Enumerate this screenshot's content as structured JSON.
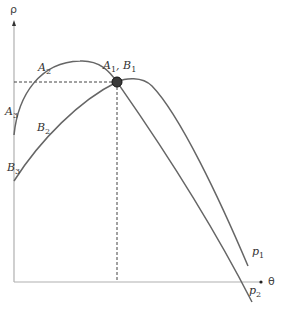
{
  "axes": {
    "y_label": "ρ",
    "x_label": "θ"
  },
  "points": {
    "intersection": {
      "label_a": "A",
      "sub_a": "1",
      "sep": ",",
      "label_b": "B",
      "sub_b": "1"
    },
    "a2": {
      "label": "A",
      "sub": "2"
    },
    "a3": {
      "label": "A",
      "sub": "3"
    },
    "b2": {
      "label": "B",
      "sub": "2"
    },
    "b3": {
      "label": "B",
      "sub": "3"
    }
  },
  "curves": {
    "p1": {
      "label": "p",
      "sub": "1"
    },
    "p2": {
      "label": "p",
      "sub": "2"
    }
  },
  "colors": {
    "curve": "#666666",
    "axis": "#aaaaaa",
    "dashed": "#555555",
    "dot": "#333333"
  }
}
